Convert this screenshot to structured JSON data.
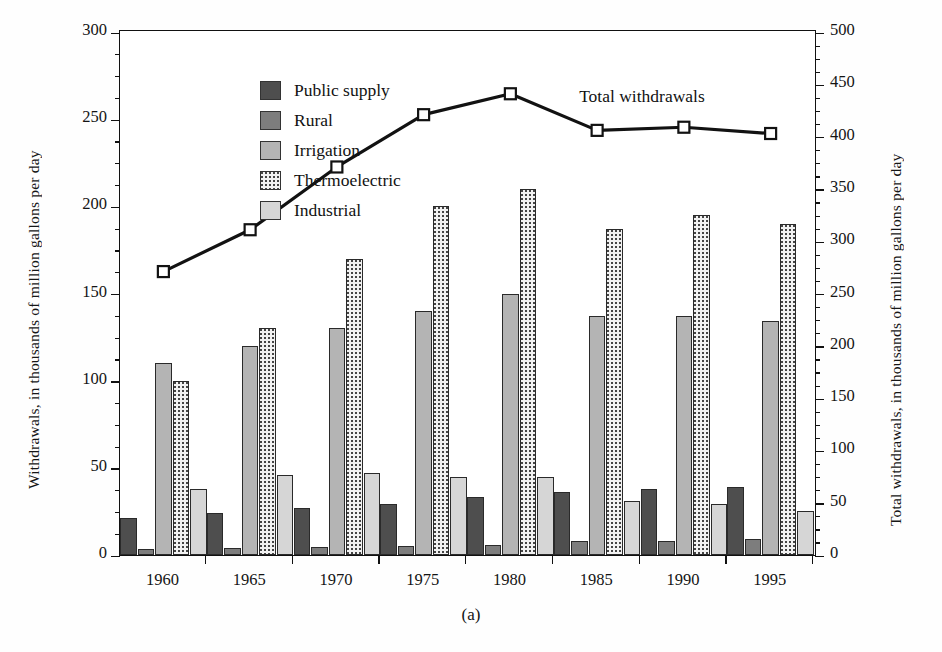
{
  "caption": "(a)",
  "axes": {
    "left_title": "Withdrawals, in thousands of million gallons per day",
    "right_title": "Total withdrawals, in thousands of million gallons per day",
    "left_ticks": [
      0,
      50,
      100,
      150,
      200,
      250,
      300
    ],
    "right_ticks": [
      0,
      50,
      100,
      150,
      200,
      250,
      300,
      350,
      400,
      450,
      500
    ],
    "left_min": 0,
    "left_max": 300,
    "right_min": 0,
    "right_max": 500,
    "x_ticks": [
      "1960",
      "1965",
      "1970",
      "1975",
      "1980",
      "1985",
      "1990",
      "1995"
    ]
  },
  "legend": {
    "position": "inside-top-left",
    "items": [
      {
        "label": "Public supply",
        "key": "public_supply",
        "color": "#4e4e4e",
        "pattern": "solid-dark"
      },
      {
        "label": "Rural",
        "key": "rural",
        "color": "#7d7d7d",
        "pattern": "solid-mid"
      },
      {
        "label": "Irrigation",
        "key": "irrigation",
        "color": "#b4b4b4",
        "pattern": "solid-light"
      },
      {
        "label": "Thermoelectric",
        "key": "thermoelectric",
        "color": "#f2f2f2",
        "pattern": "dotted"
      },
      {
        "label": "Industrial",
        "key": "industrial",
        "color": "#d6d6d6",
        "pattern": "solid-pale"
      }
    ]
  },
  "line_annotation": "Total withdrawals",
  "chart_data": {
    "type": "bar",
    "title": "",
    "subtitle": "",
    "xlabel": "",
    "ylabel": "Withdrawals, in thousands of million gallons per day",
    "y2label": "Total withdrawals, in thousands of million gallons per day",
    "categories": [
      "1960",
      "1965",
      "1970",
      "1975",
      "1980",
      "1985",
      "1990",
      "1995"
    ],
    "ylim": [
      0,
      300
    ],
    "y2lim": [
      0,
      500
    ],
    "grid": false,
    "legend_position": "upper left",
    "series": [
      {
        "name": "Public supply",
        "axis": "left",
        "type": "bar",
        "values": [
          21,
          24,
          27,
          29,
          33,
          36,
          38,
          39
        ]
      },
      {
        "name": "Rural",
        "axis": "left",
        "type": "bar",
        "values": [
          3.6,
          4.0,
          4.5,
          4.9,
          5.6,
          7.8,
          7.9,
          8.9
        ]
      },
      {
        "name": "Irrigation",
        "axis": "left",
        "type": "bar",
        "values": [
          110,
          120,
          130,
          140,
          150,
          137,
          137,
          134
        ]
      },
      {
        "name": "Thermoelectric",
        "axis": "left",
        "type": "bar",
        "values": [
          100,
          130,
          170,
          200,
          210,
          187,
          195,
          190
        ]
      },
      {
        "name": "Industrial",
        "axis": "left",
        "type": "bar",
        "values": [
          38,
          46,
          47,
          45,
          45,
          31,
          29,
          25
        ]
      },
      {
        "name": "Total withdrawals",
        "axis": "right",
        "type": "line",
        "marker": "open-square",
        "values": [
          270,
          310,
          370,
          420,
          440,
          405,
          408,
          402
        ]
      }
    ]
  }
}
